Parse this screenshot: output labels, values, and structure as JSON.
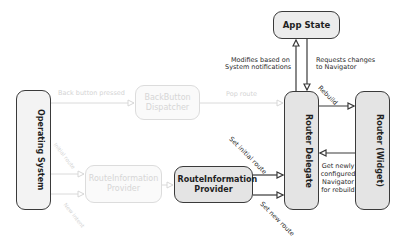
{
  "diagram": {
    "nodes": {
      "app_state": "App State",
      "operating_system": "Operating System",
      "backbutton_dispatcher": "BackButton Dispatcher",
      "routeinfo_provider_faded": "RouteInformation Provider",
      "routeinfo_provider": "RouteInformation Provider",
      "router_delegate": "Router Delegate",
      "router_widget": "Router (Widget)"
    },
    "edges": {
      "back_button_pressed": "Back button pressed",
      "pop_route": "Pop route",
      "modifies_line1": "Modifies based on",
      "modifies_line2": "System notifications",
      "requests_line1": "Requests changes",
      "requests_line2": "to Navigator",
      "rebuild": "Rebuild",
      "set_initial_route": "Set initial route",
      "set_new_route": "Set new route",
      "get_newly_line1": "Get newly",
      "get_newly_line2": "configured",
      "get_newly_line3": "Navigator",
      "get_newly_line4": "for rebuild",
      "os_initial_route": "Initial route",
      "os_new_intent": "New intent"
    },
    "colors": {
      "node_fill": "#e4e4e4",
      "node_border": "#3a3a3a",
      "faded": "#d6d6d6",
      "line": "#3a3a3a"
    }
  }
}
